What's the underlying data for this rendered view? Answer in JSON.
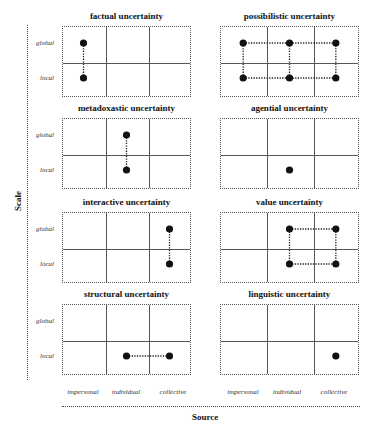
{
  "axes": {
    "y_title": "Scale",
    "x_title": "Source",
    "row_labels": [
      "global",
      "local"
    ],
    "col_labels": [
      "impersonal",
      "individual",
      "collective"
    ]
  },
  "panels": [
    {
      "title": "factual uncertainty",
      "points": [
        [
          0,
          0
        ],
        [
          0,
          1
        ]
      ],
      "links": [
        [
          [
            0,
            0
          ],
          [
            0,
            1
          ]
        ]
      ]
    },
    {
      "title": "possibilistic uncertainty",
      "points": [
        [
          0,
          0
        ],
        [
          1,
          0
        ],
        [
          2,
          0
        ],
        [
          0,
          1
        ],
        [
          1,
          1
        ],
        [
          2,
          1
        ]
      ],
      "links": [
        [
          [
            0,
            0
          ],
          [
            2,
            0
          ]
        ],
        [
          [
            0,
            1
          ],
          [
            2,
            1
          ]
        ],
        [
          [
            0,
            0
          ],
          [
            0,
            1
          ]
        ],
        [
          [
            1,
            0
          ],
          [
            1,
            1
          ]
        ],
        [
          [
            2,
            0
          ],
          [
            2,
            1
          ]
        ]
      ]
    },
    {
      "title": "metadoxastic uncertainty",
      "points": [
        [
          1,
          0
        ],
        [
          1,
          1
        ]
      ],
      "links": [
        [
          [
            1,
            0
          ],
          [
            1,
            1
          ]
        ]
      ]
    },
    {
      "title": "agential uncertainty",
      "points": [
        [
          1,
          1
        ]
      ],
      "links": []
    },
    {
      "title": "interactive uncertainty",
      "points": [
        [
          2,
          0
        ],
        [
          2,
          1
        ]
      ],
      "links": [
        [
          [
            2,
            0
          ],
          [
            2,
            1
          ]
        ]
      ]
    },
    {
      "title": "value uncertainty",
      "points": [
        [
          1,
          0
        ],
        [
          2,
          0
        ],
        [
          1,
          1
        ],
        [
          2,
          1
        ]
      ],
      "links": [
        [
          [
            1,
            0
          ],
          [
            2,
            0
          ]
        ],
        [
          [
            1,
            1
          ],
          [
            2,
            1
          ]
        ],
        [
          [
            1,
            0
          ],
          [
            1,
            1
          ]
        ],
        [
          [
            2,
            0
          ],
          [
            2,
            1
          ]
        ]
      ]
    },
    {
      "title": "structural uncertainty",
      "points": [
        [
          1,
          1
        ],
        [
          2,
          1
        ]
      ],
      "links": [
        [
          [
            1,
            1
          ],
          [
            2,
            1
          ]
        ]
      ]
    },
    {
      "title": "linguistic uncertainty",
      "points": [
        [
          2,
          1
        ]
      ],
      "links": []
    }
  ],
  "chart_data": {
    "type": "scatter",
    "title": "",
    "xlabel": "Source",
    "ylabel": "Scale",
    "x_categories": [
      "impersonal",
      "individual",
      "collective"
    ],
    "y_categories": [
      "global",
      "local"
    ],
    "facets": [
      {
        "name": "factual uncertainty",
        "points": [
          [
            "impersonal",
            "global"
          ],
          [
            "impersonal",
            "local"
          ]
        ]
      },
      {
        "name": "possibilistic uncertainty",
        "points": [
          [
            "impersonal",
            "global"
          ],
          [
            "individual",
            "global"
          ],
          [
            "collective",
            "global"
          ],
          [
            "impersonal",
            "local"
          ],
          [
            "individual",
            "local"
          ],
          [
            "collective",
            "local"
          ]
        ]
      },
      {
        "name": "metadoxastic uncertainty",
        "points": [
          [
            "individual",
            "global"
          ],
          [
            "individual",
            "local"
          ]
        ]
      },
      {
        "name": "agential uncertainty",
        "points": [
          [
            "individual",
            "local"
          ]
        ]
      },
      {
        "name": "interactive uncertainty",
        "points": [
          [
            "collective",
            "global"
          ],
          [
            "collective",
            "local"
          ]
        ]
      },
      {
        "name": "value uncertainty",
        "points": [
          [
            "individual",
            "global"
          ],
          [
            "collective",
            "global"
          ],
          [
            "individual",
            "local"
          ],
          [
            "collective",
            "local"
          ]
        ]
      },
      {
        "name": "structural uncertainty",
        "points": [
          [
            "individual",
            "local"
          ],
          [
            "collective",
            "local"
          ]
        ]
      },
      {
        "name": "linguistic uncertainty",
        "points": [
          [
            "collective",
            "local"
          ]
        ]
      }
    ],
    "grid": true
  }
}
